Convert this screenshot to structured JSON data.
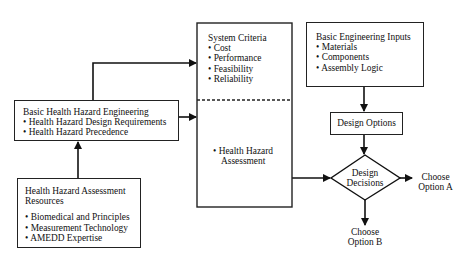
{
  "diagram": {
    "system_criteria": {
      "title": "System Criteria",
      "items": [
        "Cost",
        "Performance",
        "Feasibility",
        "Reliability"
      ]
    },
    "health_hazard_assessment_item": [
      "• Health Hazard",
      "Assessment"
    ],
    "basic_engineering_inputs": {
      "title": "Basic Engineering Inputs",
      "items": [
        "Materials",
        "Components",
        "Assembly Logic"
      ]
    },
    "basic_hhe": {
      "title": "Basic Health Hazard Engineering",
      "items": [
        "Health Hazard Design Requirements",
        "Health Hazard Precedence"
      ]
    },
    "hha_resources": {
      "title_lines": [
        "Health Hazard Assessment",
        "Resources"
      ],
      "items": [
        "Biomedical and Principles",
        "Measurement Technology",
        "AMEDD Expertise"
      ]
    },
    "design_options": "Design Options",
    "design_decisions": [
      "Design",
      "Decisions"
    ],
    "option_a": [
      "Choose",
      "Option A"
    ],
    "option_b": [
      "Choose",
      "Option B"
    ],
    "bullet": "•"
  }
}
